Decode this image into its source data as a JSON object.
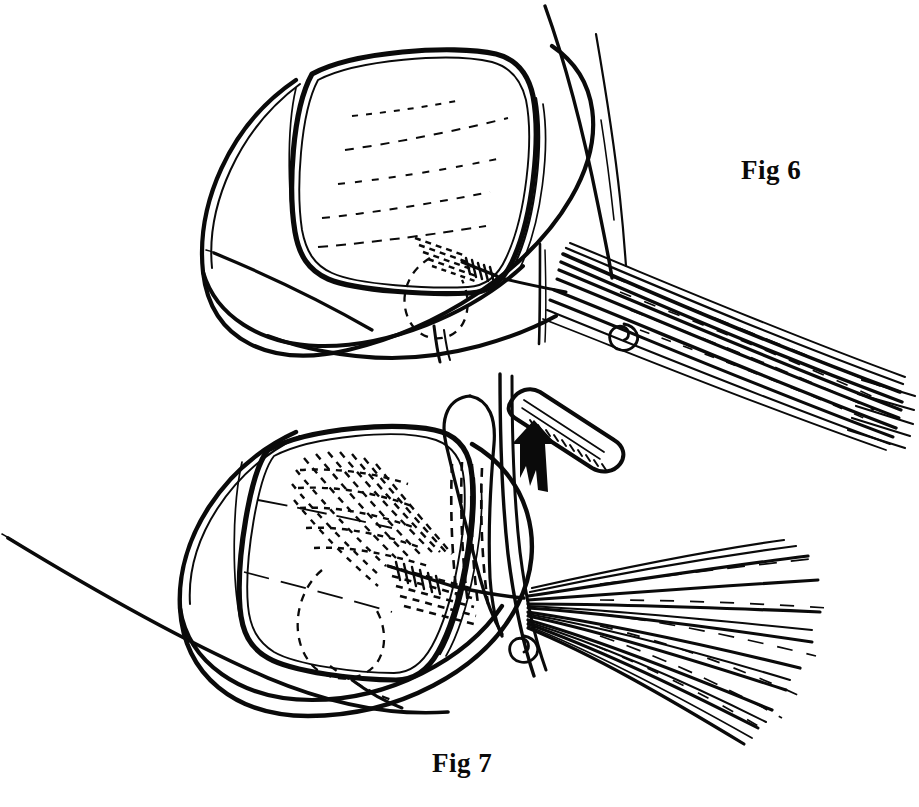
{
  "sheet": {
    "width": 919,
    "height": 807,
    "background_color": "#ffffff",
    "ink_color": "#0a0a0a",
    "medium": "line-drawing",
    "subject": "ophthalmic surgical illustration of corneal graft with suture bundle"
  },
  "captions": {
    "fig6": "Fig 6",
    "fig7": "Fig 7"
  },
  "figures": [
    {
      "id": "fig6",
      "label": "Fig 6",
      "label_position": {
        "x": 741,
        "y": 155
      },
      "description": "Upper panel: eye globe with square corneal graft, sutures gathered into a tight parallel bundle directed down-right",
      "parts": [
        {
          "name": "globe-outline",
          "type": "curve"
        },
        {
          "name": "corneal-graft-outline",
          "type": "rounded-square"
        },
        {
          "name": "graft-inner-rim",
          "type": "thin-parallel-outline"
        },
        {
          "name": "hidden-suture-dashes",
          "type": "dashed"
        },
        {
          "name": "suture-knot-whipping",
          "type": "coiled-wrap"
        },
        {
          "name": "suture-bundle-parallel",
          "type": "thread-bundle",
          "thread_count": 11
        },
        {
          "name": "suture-spiral-coil",
          "type": "spiral",
          "position": {
            "x": 617,
            "y": 333
          }
        },
        {
          "name": "needle-thread-vertical",
          "type": "thread"
        },
        {
          "name": "free-thread-upper-left",
          "type": "tapered-thread"
        },
        {
          "name": "free-thread-upper-right",
          "type": "tapered-thread"
        }
      ]
    },
    {
      "id": "fig7",
      "label": "Fig 7",
      "label_position": {
        "x": 432,
        "y": 748
      },
      "description": "Lower panel: same globe and graft with suture bundle fanned out to the right, a lifting instrument and an upward arrow indicating the direction of traction",
      "parts": [
        {
          "name": "globe-outline",
          "type": "curve"
        },
        {
          "name": "corneal-graft-outline",
          "type": "rounded-square"
        },
        {
          "name": "graft-inner-rim",
          "type": "thin-parallel-outline"
        },
        {
          "name": "hatched-suture-field",
          "type": "dashed-hatching"
        },
        {
          "name": "hidden-suture-dashes",
          "type": "dashed"
        },
        {
          "name": "suture-knot-whipping",
          "type": "coiled-wrap"
        },
        {
          "name": "suture-bundle-fanned",
          "type": "thread-fan",
          "thread_count": 16
        },
        {
          "name": "suture-spiral-coil",
          "type": "spiral",
          "position": {
            "x": 516,
            "y": 645
          }
        },
        {
          "name": "thread-loop",
          "type": "elongated-loop"
        },
        {
          "name": "surgical-instrument",
          "type": "rounded-tip-spatula"
        },
        {
          "name": "direction-arrow",
          "type": "solid-arrow",
          "direction": "up"
        },
        {
          "name": "free-thread-lower-left",
          "type": "tapered-thread"
        }
      ]
    }
  ]
}
